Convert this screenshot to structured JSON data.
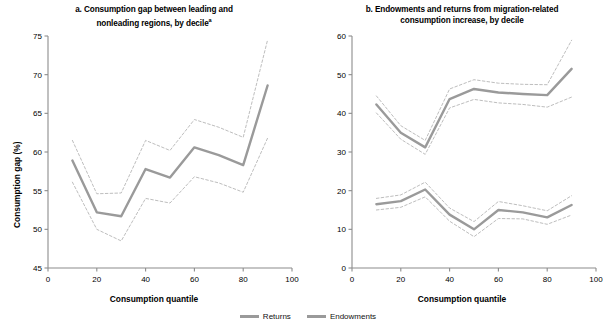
{
  "figure": {
    "background": "#ffffff",
    "line_color": "#9a9a9a",
    "ci_color": "#b5b5b5",
    "axis_color": "#8c8c8c"
  },
  "legend": {
    "items": [
      {
        "label": "Returns",
        "color": "#9a9a9a"
      },
      {
        "label": "Endowments",
        "color": "#9a9a9a"
      }
    ]
  },
  "source": {
    "text": ""
  },
  "chart_data": [
    {
      "type": "line",
      "panel": "a",
      "title_line1": "a. Consumption gap between leading and",
      "title_line2": "nonleading regions, by decile",
      "title_superscript": "a",
      "xlabel": "Consumption quantile",
      "ylabel": "Consumption gap (%)",
      "xlim": [
        0,
        100
      ],
      "ylim": [
        45,
        75
      ],
      "xticks": [
        0,
        20,
        40,
        60,
        80,
        100
      ],
      "yticks": [
        45,
        50,
        55,
        60,
        65,
        70,
        75
      ],
      "grid": false,
      "legend_position": "below-figure",
      "x": [
        10,
        20,
        30,
        40,
        50,
        60,
        70,
        80,
        90
      ],
      "series": [
        {
          "name": "Consumption gap",
          "style": "solid",
          "values": [
            58.9,
            52.2,
            51.7,
            57.8,
            56.7,
            60.6,
            59.6,
            58.3,
            68.6
          ]
        },
        {
          "name": "Upper confidence bound",
          "style": "dashed",
          "values": [
            61.5,
            54.6,
            54.7,
            61.5,
            60.2,
            64.2,
            63.2,
            61.9,
            74.5
          ]
        },
        {
          "name": "Lower confidence bound",
          "style": "dashed",
          "values": [
            56.1,
            50.0,
            48.5,
            54.0,
            53.4,
            56.8,
            56.0,
            54.8,
            61.8
          ]
        }
      ]
    },
    {
      "type": "line",
      "panel": "b",
      "title_line1": "b. Endowments and returns from migration-related",
      "title_line2": "consumption increase, by decile",
      "title_superscript": "",
      "xlabel": "Consumption quantile",
      "ylabel": "Consumption increase (%)",
      "xlim": [
        0,
        100
      ],
      "ylim": [
        0,
        60
      ],
      "xticks": [
        0,
        20,
        40,
        60,
        80,
        100
      ],
      "yticks": [
        0,
        10,
        20,
        30,
        40,
        50,
        60
      ],
      "grid": false,
      "legend_position": "below-figure",
      "x": [
        10,
        20,
        30,
        40,
        50,
        60,
        70,
        80,
        90
      ],
      "series": [
        {
          "name": "Returns",
          "style": "solid",
          "values": [
            42.3,
            35.0,
            31.2,
            43.7,
            46.3,
            45.4,
            45.0,
            44.7,
            51.5
          ]
        },
        {
          "name": "Returns upper bound",
          "style": "dashed",
          "values": [
            44.5,
            36.8,
            33.0,
            46.3,
            48.7,
            47.8,
            47.5,
            47.4,
            58.9
          ]
        },
        {
          "name": "Returns lower bound",
          "style": "dashed",
          "values": [
            40.1,
            33.3,
            29.4,
            41.4,
            43.6,
            42.7,
            42.3,
            41.6,
            44.2
          ]
        },
        {
          "name": "Endowments",
          "style": "solid",
          "values": [
            16.5,
            17.3,
            20.3,
            13.8,
            10.0,
            15.0,
            14.4,
            13.1,
            16.3
          ]
        },
        {
          "name": "Endowments upper bound",
          "style": "dashed",
          "values": [
            18.0,
            18.9,
            22.2,
            15.5,
            12.0,
            17.2,
            16.1,
            14.8,
            18.7
          ]
        },
        {
          "name": "Endowments lower bound",
          "style": "dashed",
          "values": [
            15.0,
            15.7,
            18.4,
            12.1,
            8.1,
            12.8,
            12.7,
            11.3,
            13.7
          ]
        }
      ]
    }
  ]
}
